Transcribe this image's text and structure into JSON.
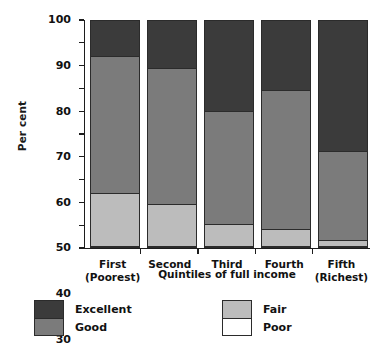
{
  "chart_data": {
    "type": "bar",
    "subtype": "stacked-100",
    "title": "",
    "xlabel": "Quintiles of full income",
    "ylabel": "Per cent",
    "ylim": [
      0,
      100
    ],
    "yticks": [
      0,
      10,
      20,
      30,
      40,
      50,
      60,
      70,
      80,
      90,
      100
    ],
    "grid": false,
    "legend_position": "bottom",
    "categories": [
      "First\n(Poorest)",
      "Second",
      "Third",
      "Fourth",
      "Fifth\n(Richest)"
    ],
    "category_lines": [
      {
        "line1": "First",
        "line2": "(Poorest)"
      },
      {
        "line1": "Second",
        "line2": ""
      },
      {
        "line1": "Third",
        "line2": ""
      },
      {
        "line1": "Fourth",
        "line2": ""
      },
      {
        "line1": "Fifth",
        "line2": "(Richest)"
      }
    ],
    "series": [
      {
        "name": "Excellent",
        "color": "#3b3b3b",
        "values": [
          16,
          21,
          40,
          31,
          58
        ]
      },
      {
        "name": "Good",
        "color": "#7b7b7b",
        "values": [
          60,
          60,
          50,
          61,
          39
        ]
      },
      {
        "name": "Fair",
        "color": "#bcbcbc",
        "values": [
          23,
          18.5,
          9.5,
          7.7,
          2.7
        ]
      },
      {
        "name": "Poor",
        "color": "#ffffff",
        "values": [
          1,
          0.5,
          0.5,
          0.3,
          0.3
        ]
      }
    ],
    "stack_boundaries_percent": [
      {
        "category": "First (Poorest)",
        "poor_top": 1,
        "fair_top": 24,
        "good_top": 84,
        "excellent_top": 100
      },
      {
        "category": "Second",
        "poor_top": 0.5,
        "fair_top": 19,
        "good_top": 79,
        "excellent_top": 100
      },
      {
        "category": "Third",
        "poor_top": 0.5,
        "fair_top": 10,
        "good_top": 60,
        "excellent_top": 100
      },
      {
        "category": "Fourth",
        "poor_top": 0.3,
        "fair_top": 8,
        "good_top": 69,
        "excellent_top": 100
      },
      {
        "category": "Fifth (Richest)",
        "poor_top": 0.3,
        "fair_top": 3,
        "good_top": 42,
        "excellent_top": 100
      }
    ]
  },
  "legend": {
    "columns": [
      {
        "entries": [
          {
            "label": "Excellent",
            "color": "#3b3b3b"
          },
          {
            "label": "Good",
            "color": "#7b7b7b"
          }
        ]
      },
      {
        "entries": [
          {
            "label": "Fair",
            "color": "#bcbcbc"
          },
          {
            "label": "Poor",
            "color": "#ffffff"
          }
        ]
      }
    ]
  },
  "axes": {
    "y_title": "Per cent",
    "x_title": "Quintiles of full income",
    "y_tick_labels": [
      "100",
      "90",
      "80",
      "70",
      "60",
      "50",
      "40",
      "30",
      "20",
      "10",
      "0"
    ]
  }
}
